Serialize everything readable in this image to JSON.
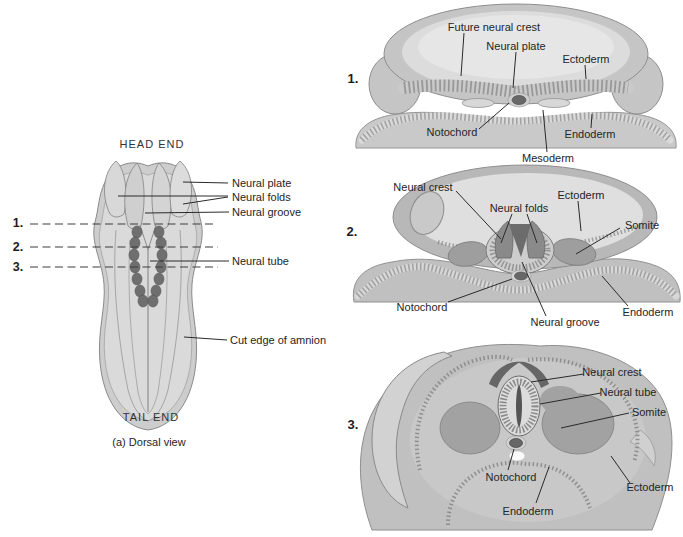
{
  "colors": {
    "background": "#ffffff",
    "text": "#252525",
    "leader_line": "#2a2a2a",
    "section_line": "#3c3c3c",
    "tissue_outline": "#8a8a8a",
    "tissue_mid": "#c6c6c6",
    "tissue_light": "#dedede",
    "tissue_dark": "#8f8f8f",
    "structure_dark": "#676767"
  },
  "dorsal_view": {
    "title_top": "HEAD END",
    "title_bottom": "TAIL END",
    "caption": "(a) Dorsal view",
    "section_markers": [
      "1.",
      "2.",
      "3."
    ],
    "labels": {
      "neural_plate": "Neural plate",
      "neural_folds": "Neural folds",
      "neural_groove": "Neural groove",
      "neural_tube": "Neural tube",
      "cut_edge_of_amnion": "Cut edge of amnion"
    }
  },
  "cross_sections": [
    {
      "number": "1.",
      "labels": {
        "future_neural_crest": "Future neural crest",
        "neural_plate": "Neural plate",
        "ectoderm": "Ectoderm",
        "notochord": "Notochord",
        "endoderm": "Endoderm",
        "mesoderm": "Mesoderm"
      }
    },
    {
      "number": "2.",
      "labels": {
        "neural_crest": "Neural crest",
        "neural_folds": "Neural folds",
        "ectoderm": "Ectoderm",
        "somite": "Somite",
        "notochord": "Notochord",
        "neural_groove": "Neural groove",
        "endoderm": "Endoderm"
      }
    },
    {
      "number": "3.",
      "labels": {
        "neural_crest": "Neural crest",
        "neural_tube": "Neural tube",
        "somite": "Somite",
        "notochord": "Notochord",
        "ectoderm": "Ectoderm",
        "endoderm": "Endoderm"
      }
    }
  ]
}
